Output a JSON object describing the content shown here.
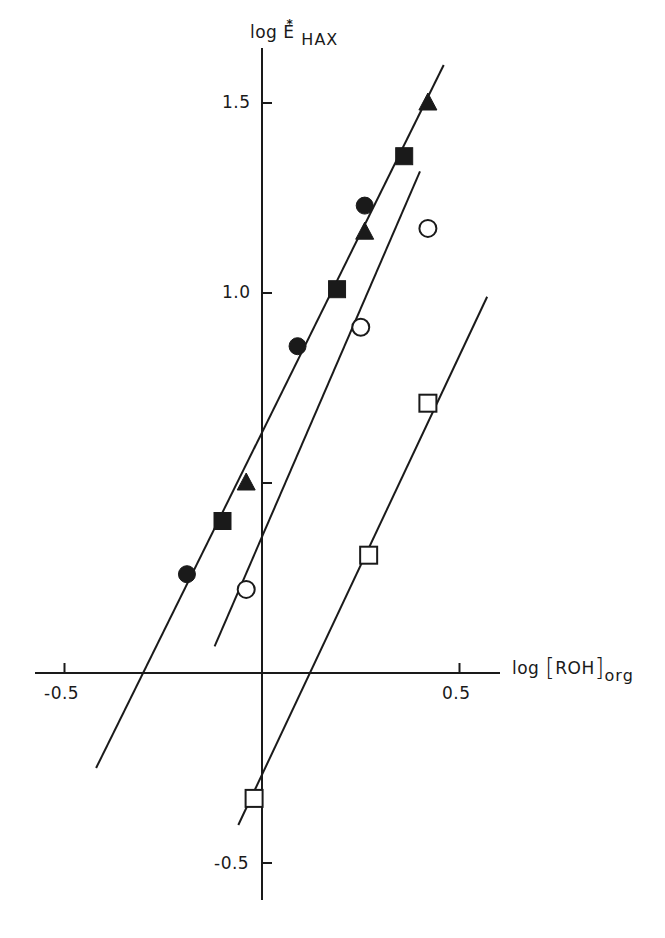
{
  "chart_data": {
    "type": "scatter",
    "title": "",
    "xlabel": "log [ROH]org",
    "ylabel": "log E*HAX",
    "xlabel_parts": {
      "main": "log",
      "open": "[",
      "inner": "ROH",
      "close": "]",
      "sub": "org"
    },
    "ylabel_parts": {
      "main": "log E",
      "sup": "*",
      "sub": "HAX"
    },
    "xlim": [
      -0.58,
      0.58
    ],
    "ylim": [
      -0.6,
      1.65
    ],
    "x_ticks": [
      {
        "value": -0.5,
        "label": "-0.5"
      },
      {
        "value": 0.5,
        "label": "0.5"
      }
    ],
    "y_ticks": [
      {
        "value": -0.5,
        "label": "-0.5"
      },
      {
        "value": 0.5,
        "label": ""
      },
      {
        "value": 1.0,
        "label": "1.0"
      },
      {
        "value": 1.5,
        "label": "1.5"
      }
    ],
    "grid": false,
    "legend": "none",
    "series": [
      {
        "name": "filled-circle",
        "marker": "circle",
        "filled": true,
        "x": [
          -0.19,
          0.09,
          0.26
        ],
        "y": [
          0.26,
          0.86,
          1.23
        ]
      },
      {
        "name": "filled-square",
        "marker": "square",
        "filled": true,
        "x": [
          -0.1,
          0.19,
          0.36
        ],
        "y": [
          0.4,
          1.01,
          1.36
        ]
      },
      {
        "name": "filled-triangle",
        "marker": "triangle",
        "filled": true,
        "x": [
          -0.04,
          0.26,
          0.42
        ],
        "y": [
          0.5,
          1.16,
          1.5
        ]
      },
      {
        "name": "open-circle",
        "marker": "circle",
        "filled": false,
        "x": [
          -0.04,
          0.25,
          0.42
        ],
        "y": [
          0.22,
          0.91,
          1.17
        ]
      },
      {
        "name": "open-square",
        "marker": "square",
        "filled": false,
        "x": [
          -0.02,
          0.27,
          0.42
        ],
        "y": [
          -0.33,
          0.31,
          0.71
        ]
      }
    ],
    "fit_lines": [
      {
        "name": "line-filled-symbols",
        "x": [
          -0.42,
          0.46
        ],
        "y": [
          -0.25,
          1.6
        ],
        "slope": 2.1,
        "intercept": 0.62
      },
      {
        "name": "line-open-circles",
        "x": [
          -0.12,
          0.4
        ],
        "y": [
          0.07,
          1.32
        ],
        "slope": 2.35,
        "intercept": 0.32
      },
      {
        "name": "line-open-squares",
        "x": [
          -0.06,
          0.57
        ],
        "y": [
          -0.4,
          0.99
        ],
        "slope": 2.25,
        "intercept": -0.27
      }
    ]
  },
  "axes": {
    "x_label_prefix": "log",
    "x_label_bracket_open": "[",
    "x_label_inner": "ROH",
    "x_label_bracket_close": "]",
    "x_label_sub": "org",
    "y_label_main": "log E",
    "y_label_sup": "*",
    "y_label_sub": "HAX",
    "x_tick_neg": "-0.5",
    "x_tick_pos": "0.5",
    "y_tick_15": "1.5",
    "y_tick_10": "1.0",
    "y_tick_neg05": "-0.5"
  }
}
